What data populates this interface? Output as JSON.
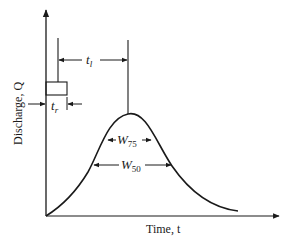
{
  "diagram": {
    "type": "hydrograph",
    "y_axis_label": "Discharge, Q",
    "x_axis_label": "Time, t",
    "annotations": {
      "lag_time": {
        "symbol": "t",
        "subscript": "l"
      },
      "rainfall_duration": {
        "symbol": "t",
        "subscript": "r"
      },
      "width_75": {
        "symbol": "W",
        "subscript": "75"
      },
      "width_50": {
        "symbol": "W",
        "subscript": "50"
      }
    },
    "colors": {
      "line": "#1a1a1a",
      "background": "#ffffff"
    }
  }
}
